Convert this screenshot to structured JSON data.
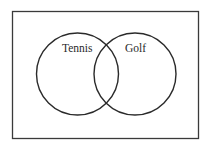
{
  "diagram": {
    "type": "venn",
    "universe": {
      "label": ""
    },
    "sets": [
      {
        "label": "Tennis"
      },
      {
        "label": "Golf"
      }
    ],
    "colors": {
      "stroke": "#2a2a2a",
      "background": "#ffffff"
    }
  }
}
